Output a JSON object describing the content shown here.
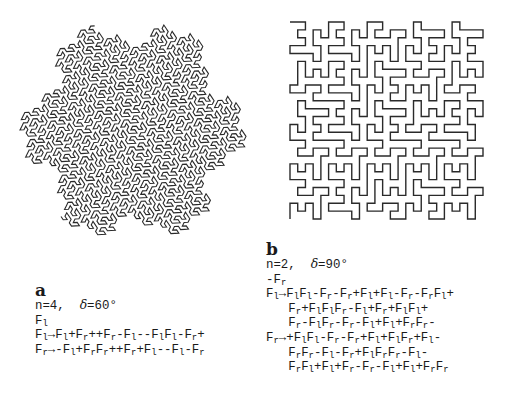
{
  "panels": [
    {
      "id": "a",
      "label": "a",
      "params": "n=4,  δ=60°",
      "n": 4,
      "delta_deg": 60,
      "axiom": "F_l",
      "axiom_display": "F₁",
      "rules": [
        {
          "lhs": "F_l",
          "rhs": "F_l+F_r++F_r-F_l--F_lF_l-F_r+",
          "display": "F₁→F₁+F_r++F_r-F₁--F₁F₁-F_r+"
        },
        {
          "lhs": "F_r",
          "rhs": "-F_l+F_rF_r++F_r+F_l--F_l-F_r",
          "display": "F_r→-F₁+F_rF_r++F_r+F₁--F₁-F_r"
        }
      ],
      "lines": [
        [
          [
            "t",
            "n=4,  "
          ],
          [
            "i",
            "δ"
          ],
          [
            "t",
            "=60°"
          ]
        ],
        [
          [
            "t",
            "F"
          ],
          [
            "s",
            "l"
          ]
        ],
        [
          [
            "t",
            "F"
          ],
          [
            "s",
            "l"
          ],
          [
            "t",
            "→F"
          ],
          [
            "s",
            "l"
          ],
          [
            "t",
            "+F"
          ],
          [
            "s",
            "r"
          ],
          [
            "t",
            "++F"
          ],
          [
            "s",
            "r"
          ],
          [
            "t",
            "-F"
          ],
          [
            "s",
            "l"
          ],
          [
            "t",
            "--F"
          ],
          [
            "s",
            "l"
          ],
          [
            "t",
            "F"
          ],
          [
            "s",
            "l"
          ],
          [
            "t",
            "-F"
          ],
          [
            "s",
            "r"
          ],
          [
            "t",
            "+"
          ]
        ],
        [
          [
            "t",
            "F"
          ],
          [
            "s",
            "r"
          ],
          [
            "t",
            "→-F"
          ],
          [
            "s",
            "l"
          ],
          [
            "t",
            "+F"
          ],
          [
            "s",
            "r"
          ],
          [
            "t",
            "F"
          ],
          [
            "s",
            "r"
          ],
          [
            "t",
            "++F"
          ],
          [
            "s",
            "r"
          ],
          [
            "t",
            "+F"
          ],
          [
            "s",
            "l"
          ],
          [
            "t",
            "--F"
          ],
          [
            "s",
            "l"
          ],
          [
            "t",
            "-F"
          ],
          [
            "s",
            "r"
          ]
        ]
      ],
      "figure_name": "Gosper curve"
    },
    {
      "id": "b",
      "label": "b",
      "params": "n=2,  δ=90°",
      "n": 2,
      "delta_deg": 90,
      "axiom": "-F_r",
      "axiom_display": "-F_r",
      "rules": [
        {
          "lhs": "F_l",
          "rhs": "F_lF_l-F_r-F_r+F_l+F_l-F_r-F_rF_l+F_r+F_lF_lF_r-F_l+F_r+F_lF_l+F_r-F_lF_r-F_r-F_l+F_l+F_rF_r-"
        },
        {
          "lhs": "F_r",
          "rhs": "+F_lF_l-F_r-F_r+F_l+F_lF_r+F_l-F_rF_r-F_l-F_r+F_lF_rF_r-F_l-F_rF_l+F_l+F_r-F_r-F_l+F_l+F_rF_r"
        }
      ],
      "lines": [
        [
          [
            "t",
            "n=2,  "
          ],
          [
            "i",
            "δ"
          ],
          [
            "t",
            "=90°"
          ]
        ],
        [
          [
            "t",
            "-F"
          ],
          [
            "s",
            "r"
          ]
        ],
        [
          [
            "t",
            "F"
          ],
          [
            "s",
            "l"
          ],
          [
            "t",
            "→F"
          ],
          [
            "s",
            "l"
          ],
          [
            "t",
            "F"
          ],
          [
            "s",
            "l"
          ],
          [
            "t",
            "-F"
          ],
          [
            "s",
            "r"
          ],
          [
            "t",
            "-F"
          ],
          [
            "s",
            "r"
          ],
          [
            "t",
            "+F"
          ],
          [
            "s",
            "l"
          ],
          [
            "t",
            "+F"
          ],
          [
            "s",
            "l"
          ],
          [
            "t",
            "-F"
          ],
          [
            "s",
            "r"
          ],
          [
            "t",
            "-F"
          ],
          [
            "s",
            "r"
          ],
          [
            "t",
            "F"
          ],
          [
            "s",
            "l"
          ],
          [
            "t",
            "+"
          ]
        ],
        [
          [
            "t",
            "   F"
          ],
          [
            "s",
            "r"
          ],
          [
            "t",
            "+F"
          ],
          [
            "s",
            "l"
          ],
          [
            "t",
            "F"
          ],
          [
            "s",
            "l"
          ],
          [
            "t",
            "F"
          ],
          [
            "s",
            "r"
          ],
          [
            "t",
            "-F"
          ],
          [
            "s",
            "l"
          ],
          [
            "t",
            "+F"
          ],
          [
            "s",
            "r"
          ],
          [
            "t",
            "+F"
          ],
          [
            "s",
            "l"
          ],
          [
            "t",
            "F"
          ],
          [
            "s",
            "l"
          ],
          [
            "t",
            "+"
          ]
        ],
        [
          [
            "t",
            "   F"
          ],
          [
            "s",
            "r"
          ],
          [
            "t",
            "-F"
          ],
          [
            "s",
            "l"
          ],
          [
            "t",
            "F"
          ],
          [
            "s",
            "r"
          ],
          [
            "t",
            "-F"
          ],
          [
            "s",
            "r"
          ],
          [
            "t",
            "-F"
          ],
          [
            "s",
            "l"
          ],
          [
            "t",
            "+F"
          ],
          [
            "s",
            "l"
          ],
          [
            "t",
            "+F"
          ],
          [
            "s",
            "r"
          ],
          [
            "t",
            "F"
          ],
          [
            "s",
            "r"
          ],
          [
            "t",
            "-"
          ]
        ],
        [
          [
            "t",
            "F"
          ],
          [
            "s",
            "r"
          ],
          [
            "t",
            "→+F"
          ],
          [
            "s",
            "l"
          ],
          [
            "t",
            "F"
          ],
          [
            "s",
            "l"
          ],
          [
            "t",
            "-F"
          ],
          [
            "s",
            "r"
          ],
          [
            "t",
            "-F"
          ],
          [
            "s",
            "r"
          ],
          [
            "t",
            "+F"
          ],
          [
            "s",
            "l"
          ],
          [
            "t",
            "+F"
          ],
          [
            "s",
            "l"
          ],
          [
            "t",
            "F"
          ],
          [
            "s",
            "r"
          ],
          [
            "t",
            "+F"
          ],
          [
            "s",
            "l"
          ],
          [
            "t",
            "-"
          ]
        ],
        [
          [
            "t",
            "   F"
          ],
          [
            "s",
            "r"
          ],
          [
            "t",
            "F"
          ],
          [
            "s",
            "r"
          ],
          [
            "t",
            "-F"
          ],
          [
            "s",
            "l"
          ],
          [
            "t",
            "-F"
          ],
          [
            "s",
            "r"
          ],
          [
            "t",
            "+F"
          ],
          [
            "s",
            "l"
          ],
          [
            "t",
            "F"
          ],
          [
            "s",
            "r"
          ],
          [
            "t",
            "F"
          ],
          [
            "s",
            "r"
          ],
          [
            "t",
            "-F"
          ],
          [
            "s",
            "l"
          ],
          [
            "t",
            "-"
          ]
        ],
        [
          [
            "t",
            "   F"
          ],
          [
            "s",
            "r"
          ],
          [
            "t",
            "F"
          ],
          [
            "s",
            "l"
          ],
          [
            "t",
            "+F"
          ],
          [
            "s",
            "l"
          ],
          [
            "t",
            "+F"
          ],
          [
            "s",
            "r"
          ],
          [
            "t",
            "-F"
          ],
          [
            "s",
            "r"
          ],
          [
            "t",
            "-F"
          ],
          [
            "s",
            "l"
          ],
          [
            "t",
            "+F"
          ],
          [
            "s",
            "l"
          ],
          [
            "t",
            "+F"
          ],
          [
            "s",
            "r"
          ],
          [
            "t",
            "F"
          ],
          [
            "s",
            "r"
          ]
        ]
      ],
      "figure_name": "Quadratic Peano-type curve"
    }
  ],
  "figures": {
    "a_box": {
      "x": 20,
      "y": 25,
      "w": 226,
      "h": 248
    },
    "b_box": {
      "x": 290,
      "y": 22,
      "w": 193,
      "h": 197
    }
  },
  "colors": {
    "stroke": "#2a2a2a",
    "text": "#1a1a1a",
    "background": "#ffffff"
  }
}
